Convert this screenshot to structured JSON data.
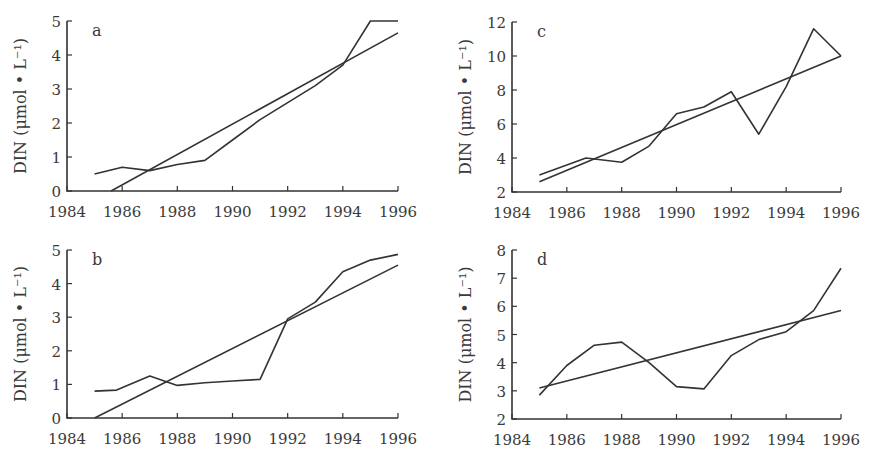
{
  "chart_data": [
    {
      "type": "line",
      "panel": "a",
      "title": "",
      "xlabel": "",
      "ylabel": "DIN (μmol • L⁻¹)",
      "xlim": [
        1984,
        1996
      ],
      "ylim": [
        0,
        5
      ],
      "xticks": [
        1984,
        1986,
        1988,
        1990,
        1992,
        1994,
        1996
      ],
      "yticks": [
        0,
        1,
        2,
        3,
        4,
        5
      ],
      "grid": false,
      "series": [
        {
          "name": "observed",
          "x": [
            1985,
            1986,
            1987,
            1988,
            1989,
            1990,
            1991,
            1992,
            1993,
            1994,
            1995,
            1996
          ],
          "y": [
            0.5,
            0.7,
            0.6,
            0.78,
            0.9,
            1.5,
            2.1,
            2.6,
            3.1,
            3.7,
            5.0,
            5.0
          ]
        },
        {
          "name": "linear-trend",
          "x": [
            1985.6,
            1996
          ],
          "y": [
            0.0,
            4.65
          ]
        }
      ]
    },
    {
      "type": "line",
      "panel": "c",
      "title": "",
      "xlabel": "",
      "ylabel": "DIN (μmol • L⁻¹)",
      "xlim": [
        1984,
        1996
      ],
      "ylim": [
        2,
        12
      ],
      "xticks": [
        1984,
        1986,
        1988,
        1990,
        1992,
        1994,
        1996
      ],
      "yticks": [
        2,
        4,
        6,
        8,
        10,
        12
      ],
      "grid": false,
      "series": [
        {
          "name": "observed",
          "x": [
            1985,
            1986.7,
            1988,
            1989,
            1990,
            1991,
            1992,
            1993,
            1994,
            1995,
            1996
          ],
          "y": [
            3.0,
            4.0,
            3.75,
            4.7,
            6.6,
            7.0,
            7.9,
            5.4,
            8.2,
            11.6,
            10.0
          ]
        },
        {
          "name": "linear-trend",
          "x": [
            1985,
            1996
          ],
          "y": [
            2.6,
            10.0
          ]
        }
      ]
    },
    {
      "type": "line",
      "panel": "b",
      "title": "",
      "xlabel": "",
      "ylabel": "DIN (μmol • L⁻¹)",
      "xlim": [
        1984,
        1996
      ],
      "ylim": [
        0,
        5
      ],
      "xticks": [
        1984,
        1986,
        1988,
        1990,
        1992,
        1994,
        1996
      ],
      "yticks": [
        0,
        1,
        2,
        3,
        4,
        5
      ],
      "grid": false,
      "series": [
        {
          "name": "observed",
          "x": [
            1985,
            1985.8,
            1987,
            1988,
            1989,
            1990,
            1991,
            1992,
            1993,
            1994,
            1995,
            1996
          ],
          "y": [
            0.8,
            0.83,
            1.25,
            0.97,
            1.05,
            1.1,
            1.15,
            2.95,
            3.45,
            4.35,
            4.7,
            4.87
          ]
        },
        {
          "name": "linear-trend",
          "x": [
            1985,
            1996
          ],
          "y": [
            0.0,
            4.55
          ]
        }
      ]
    },
    {
      "type": "line",
      "panel": "d",
      "title": "",
      "xlabel": "",
      "ylabel": "DIN (μmol • L⁻¹)",
      "xlim": [
        1984,
        1996
      ],
      "ylim": [
        2,
        8
      ],
      "xticks": [
        1984,
        1986,
        1988,
        1990,
        1992,
        1994,
        1996
      ],
      "yticks": [
        2,
        3,
        4,
        5,
        6,
        7,
        8
      ],
      "grid": false,
      "series": [
        {
          "name": "observed",
          "x": [
            1985,
            1986,
            1987,
            1988,
            1989,
            1990,
            1991,
            1992,
            1993,
            1994,
            1995,
            1996
          ],
          "y": [
            2.85,
            3.9,
            4.62,
            4.73,
            4.0,
            3.15,
            3.07,
            4.25,
            4.82,
            5.1,
            5.85,
            7.35
          ]
        },
        {
          "name": "linear-trend",
          "x": [
            1985,
            1996
          ],
          "y": [
            3.1,
            5.85
          ]
        }
      ]
    }
  ]
}
